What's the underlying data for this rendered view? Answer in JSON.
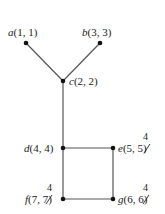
{
  "diagram": {
    "type": "tree/graph with union-find style labels",
    "nodes": [
      {
        "id": "a",
        "name": "a",
        "args": "(1, 1)",
        "x": 26,
        "y": 43
      },
      {
        "id": "b",
        "name": "b",
        "args": "(3, 3)",
        "x": 100,
        "y": 43
      },
      {
        "id": "c",
        "name": "c",
        "args": "(2, 2)",
        "x": 63,
        "y": 81
      },
      {
        "id": "d",
        "name": "d",
        "args": "(4, 4)",
        "x": 63,
        "y": 148
      },
      {
        "id": "e",
        "name": "e",
        "first": "5",
        "second": "5",
        "superscript": "4",
        "x": 113,
        "y": 148
      },
      {
        "id": "f",
        "name": "f",
        "first": "7",
        "second": "7",
        "superscript": "4",
        "x": 63,
        "y": 199
      },
      {
        "id": "g",
        "name": "g",
        "first": "6",
        "second": "6",
        "superscript": "4",
        "x": 113,
        "y": 199
      }
    ],
    "edges": [
      {
        "from": "a",
        "to": "c"
      },
      {
        "from": "b",
        "to": "c"
      },
      {
        "from": "c",
        "to": "d"
      },
      {
        "from": "d",
        "to": "e"
      },
      {
        "from": "d",
        "to": "f"
      },
      {
        "from": "e",
        "to": "g"
      },
      {
        "from": "f",
        "to": "g"
      }
    ],
    "labels": {
      "a": "a",
      "a_args": "(1, 1)",
      "b": "b",
      "b_args": "(3, 3)",
      "c": "c",
      "c_args": "(2, 2)",
      "d": "d",
      "d_args": "(4, 4)",
      "e": "e",
      "e_open": "(5, ",
      "e_struck": "5",
      "e_close": ")",
      "e_sup": "4",
      "f": "f",
      "f_open": "(7, ",
      "f_struck": "7",
      "f_close": ")",
      "f_sup": "4",
      "g": "g",
      "g_open": "(6, ",
      "g_struck": "6",
      "g_close": ")",
      "g_sup": "4"
    }
  }
}
